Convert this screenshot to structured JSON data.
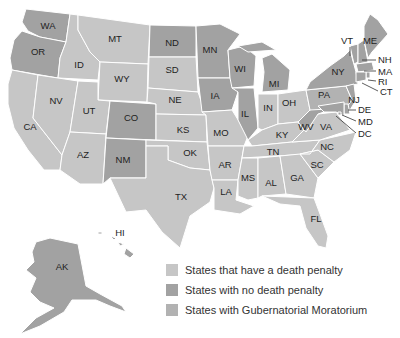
{
  "colors": {
    "death_penalty": "#c6c6c6",
    "no_death_penalty": "#a2a2a2",
    "moratorium": "#b2b2b2",
    "background": "#ffffff"
  },
  "legend": [
    {
      "key": "death_penalty",
      "label": "States that have a death penalty",
      "color": "#c6c6c6"
    },
    {
      "key": "no_death_penalty",
      "label": "States with no death penalty",
      "color": "#a2a2a2"
    },
    {
      "key": "moratorium",
      "label": "States with Gubernatorial Moratorium",
      "color": "#b2b2b2"
    }
  ],
  "states": {
    "WA": "WA",
    "OR": "OR",
    "CA": "CA",
    "ID": "ID",
    "NV": "NV",
    "MT": "MT",
    "WY": "WY",
    "UT": "UT",
    "AZ": "AZ",
    "CO": "CO",
    "NM": "NM",
    "ND": "ND",
    "SD": "SD",
    "NE": "NE",
    "KS": "KS",
    "OK": "OK",
    "TX": "TX",
    "MN": "MN",
    "IA": "IA",
    "MO": "MO",
    "AR": "AR",
    "LA": "LA",
    "WI": "WI",
    "IL": "IL",
    "MI": "MI",
    "IN": "IN",
    "OH": "OH",
    "KY": "KY",
    "TN": "TN",
    "MS": "MS",
    "AL": "AL",
    "GA": "GA",
    "FL": "FL",
    "SC": "SC",
    "NC": "NC",
    "VA": "VA",
    "WV": "WV",
    "PA": "PA",
    "NY": "NY",
    "VT": "VT",
    "ME": "ME",
    "NH": "NH",
    "MA": "MA",
    "RI": "RI",
    "CT": "CT",
    "NJ": "NJ",
    "DE": "DE",
    "MD": "MD",
    "DC": "DC",
    "AK": "AK",
    "HI": "HI"
  }
}
